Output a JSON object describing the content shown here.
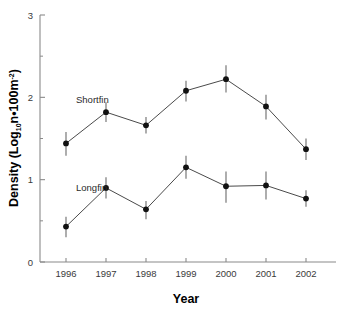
{
  "chart_data": {
    "type": "line",
    "title": "",
    "xlabel": "Year",
    "ylabel": "Density (Log10n•100m-2)",
    "ylabel_parts": {
      "prefix": "Density (Log",
      "sub1": "10",
      "mid": "n•100m",
      "sup2": "-2",
      "suffix": ")"
    },
    "categories": [
      "1996",
      "1997",
      "1998",
      "1999",
      "2000",
      "2001",
      "2002"
    ],
    "x": [
      1996,
      1997,
      1998,
      1999,
      2000,
      2001,
      2002
    ],
    "xlim": [
      1995.5,
      2002.5
    ],
    "ylim": [
      0,
      3
    ],
    "yticks": [
      0,
      1,
      2,
      3
    ],
    "ytick_labels": [
      "0",
      "1",
      "2",
      "3"
    ],
    "yminor_ticks": [
      0.5,
      1.5,
      2.5
    ],
    "grid": false,
    "legend": "inline-annotations",
    "series": [
      {
        "name": "Shortfin",
        "label_x": 1996.25,
        "label_y": 1.93,
        "values": [
          1.44,
          1.82,
          1.66,
          2.08,
          2.22,
          1.89,
          1.37
        ],
        "err_low": [
          0.15,
          0.12,
          0.1,
          0.13,
          0.16,
          0.16,
          0.13
        ],
        "err_high": [
          0.14,
          0.12,
          0.1,
          0.12,
          0.17,
          0.14,
          0.13
        ]
      },
      {
        "name": "Longfin",
        "label_x": 1996.25,
        "label_y": 0.86,
        "values": [
          0.43,
          0.9,
          0.64,
          1.15,
          0.92,
          0.93,
          0.77
        ],
        "err_low": [
          0.13,
          0.13,
          0.12,
          0.14,
          0.2,
          0.17,
          0.1
        ],
        "err_high": [
          0.12,
          0.13,
          0.1,
          0.14,
          0.18,
          0.17,
          0.1
        ]
      }
    ],
    "colors": {
      "axis": "#8a8a8a",
      "line": "#4a4a4a",
      "marker": "#111111",
      "errorbar": "#6b6b6b",
      "text": "#000000",
      "background": "#ffffff"
    }
  }
}
